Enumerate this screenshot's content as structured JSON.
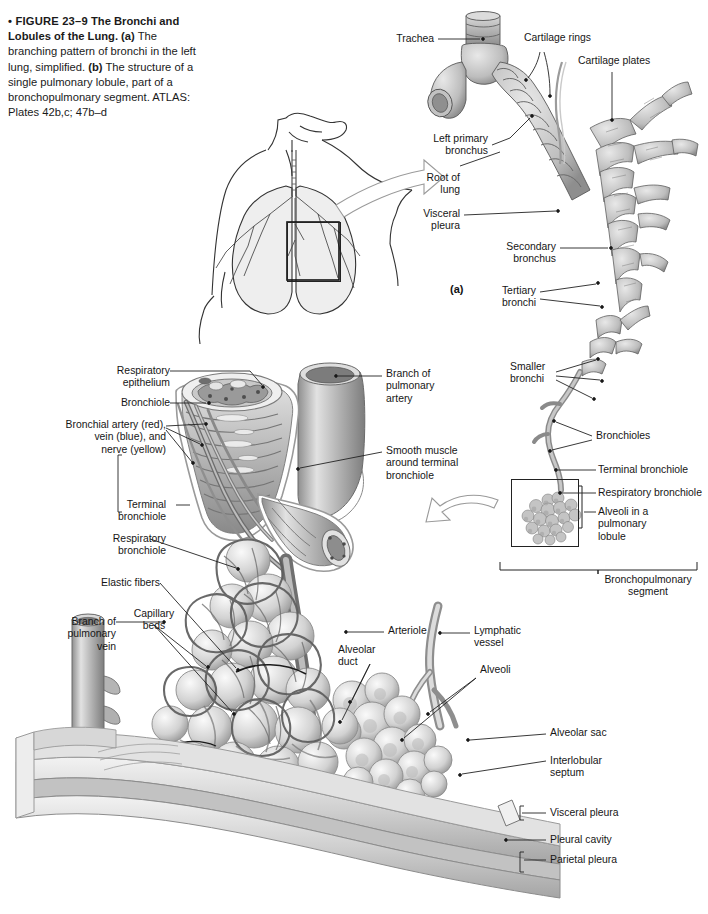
{
  "figure": {
    "number": "FIGURE 23–9",
    "title": "The Bronchi and Lobules of the Lung.",
    "part_a_marker": "(a)",
    "part_b_marker": "(b)",
    "caption_segments": [
      {
        "text": "• FIGURE 23–9",
        "style": "bold"
      },
      {
        "text": "   The Bronchi and Lobules of the Lung. ",
        "style": "bold"
      },
      {
        "text": "(a)",
        "style": "bold"
      },
      {
        "text": " The branching pattern of bronchi in the left lung, simplified. ",
        "style": "normal"
      },
      {
        "text": "(b)",
        "style": "bold"
      },
      {
        "text": " The structure of a single pulmonary lobule, part of a bronchopulmonary segment. ATLAS: Plates 42b,c; 47b–d",
        "style": "normal"
      }
    ],
    "caption_plain": "• FIGURE 23–9   The Bronchi and Lobules of the Lung. (a) The branching pattern of bronchi in the left lung, simplified. (b) The structure of a single pulmonary lobule, part of a bronchopulmonary segment. ATLAS: Plates 42b,c; 47b–d"
  },
  "panel_a": {
    "marker": "(a)",
    "labels": {
      "trachea": "Trachea",
      "cartilage_rings": "Cartilage rings",
      "cartilage_plates": "Cartilage plates",
      "left_primary_bronchus": "Left primary\nbronchus",
      "root_of_lung": "Root of\nlung",
      "visceral_pleura": "Visceral\npleura",
      "secondary_bronchus": "Secondary\nbronchus",
      "tertiary_bronchi": "Tertiary\nbronchi"
    }
  },
  "panel_a_inset": {
    "labels": {
      "smaller_bronchi": "Smaller\nbronchi",
      "bronchioles": "Bronchioles",
      "terminal_bronchiole": "Terminal bronchiole",
      "respiratory_bronchiole": "Respiratory bronchiole",
      "alveoli_in_lobule": "Alveoli in a\npulmonary\nlobule",
      "bronchopulmonary_segment": "Bronchopulmonary\nsegment"
    },
    "background_color": "#e9e9e9"
  },
  "panel_b": {
    "marker": "(b)",
    "labels": {
      "respiratory_epithelium": "Respiratory\nepithelium",
      "bronchiole": "Bronchiole",
      "bronchial_vessels": "Bronchial artery (red),\nvein (blue), and\nnerve (yellow)",
      "terminal_bronchiole": "Terminal\nbronchiole",
      "respiratory_bronchiole": "Respiratory\nbronchiole",
      "elastic_fibers": "Elastic fibers",
      "branch_pulmonary_artery": "Branch of\npulmonary\nartery",
      "smooth_muscle": "Smooth muscle\naround terminal\nbronchiole",
      "branch_pulmonary_vein": "Branch of\npulmonary\nvein",
      "capillary_beds": "Capillary\nbeds",
      "arteriole": "Arteriole",
      "alveolar_duct": "Alveolar\nduct",
      "lymphatic_vessel": "Lymphatic\nvessel",
      "alveoli": "Alveoli",
      "alveolar_sac": "Alveolar sac",
      "interlobular_septum": "Interlobular\nseptum",
      "visceral_pleura": "Visceral pleura",
      "pleural_cavity": "Pleural cavity",
      "parietal_pleura": "Parietal pleura"
    }
  },
  "colors": {
    "ink": "#161616",
    "leader": "#222222",
    "panel_background": "#e9e9e9",
    "page_background": "#ffffff",
    "art_light": "#d9d9d9",
    "art_mid": "#a8a8a8",
    "art_dark": "#6f6f6f"
  }
}
